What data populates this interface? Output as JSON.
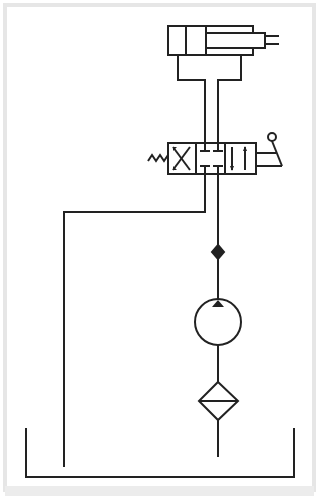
{
  "diagram": {
    "type": "hydraulic-circuit",
    "colors": {
      "background": "#ffffff",
      "frame": "#e6e6e6",
      "line": "#222222"
    },
    "components": [
      {
        "id": "double-acting-cylinder",
        "label": ""
      },
      {
        "id": "directional-control-valve-4-3",
        "label": ""
      },
      {
        "id": "return-spring",
        "label": ""
      },
      {
        "id": "hand-lever",
        "label": ""
      },
      {
        "id": "check-valve",
        "label": ""
      },
      {
        "id": "hydraulic-pump",
        "label": ""
      },
      {
        "id": "filter",
        "label": ""
      },
      {
        "id": "reservoir-tank",
        "label": ""
      }
    ]
  }
}
